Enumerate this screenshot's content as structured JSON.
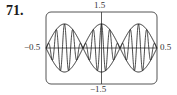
{
  "problem": {
    "number": "71."
  },
  "chart_data": {
    "type": "line",
    "title": "",
    "xlabel": "",
    "ylabel": "",
    "xlim": [
      -0.5,
      0.5
    ],
    "ylim": [
      -1.5,
      1.5
    ],
    "tick_labels": {
      "x_min": "−0.5",
      "x_max": "0.5",
      "y_max": "1.5",
      "y_min": "−1.5"
    },
    "grid": false,
    "legend": null,
    "series": [
      {
        "name": "function",
        "expression": "cos(3πx)·cos(27πx)",
        "description": "amplitude-modulated oscillation with 3 lobes"
      },
      {
        "name": "upper envelope",
        "expression": "cos(3πx)"
      },
      {
        "name": "lower envelope",
        "expression": "−cos(3πx)"
      }
    ],
    "envelope_zeros_x": [
      -0.5,
      -0.1667,
      0.1667,
      0.5
    ],
    "envelope_peak": 1.0,
    "colors": {
      "line": "#1a1a1a",
      "frame": "#555555",
      "axis": "#333333"
    }
  }
}
